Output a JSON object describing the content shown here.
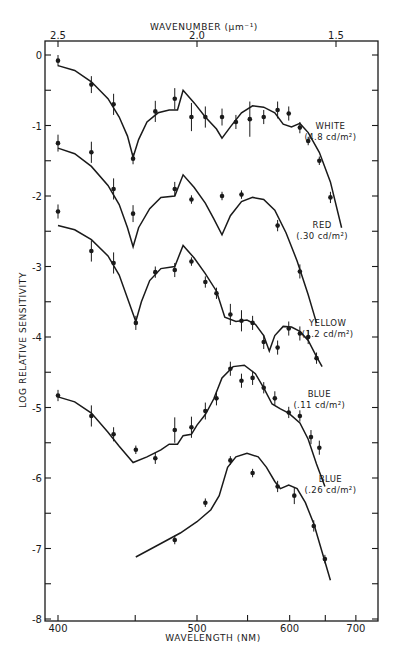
{
  "chart_data": {
    "type": "line",
    "title": "",
    "xlabel": "WAVELENGTH (NM)",
    "x2label": "WAVENUMBER (µm⁻¹)",
    "ylabel": "LOG RELATIVE SENSITIVITY",
    "ylim": [
      -8,
      0.3
    ],
    "x_wavenumber_range": [
      2.55,
      1.35
    ],
    "grid": false,
    "legend_position": "inline-right",
    "x_ticks_wavelength": [
      400,
      450,
      500,
      550,
      600,
      650,
      700
    ],
    "x_tick_labels_wavelength": [
      "400",
      "",
      "500",
      "",
      "600",
      "",
      "700"
    ],
    "x_ticks_wavenumber": [
      2.5,
      2.0,
      1.5
    ],
    "x_tick_labels_wavenumber": [
      "2.5",
      "2.0",
      "1.5"
    ],
    "y_ticks": [
      0,
      -0.5,
      -1,
      -1.5,
      -2,
      -2.5,
      -3,
      -3.5,
      -4,
      -4.5,
      -5,
      -5.5,
      -6,
      -6.5,
      -7,
      -7.5,
      -8
    ],
    "y_tick_labels": [
      "0",
      "-1",
      "-2",
      "-3",
      "-4",
      "-5",
      "-6",
      "-7",
      "-8"
    ],
    "series": [
      {
        "name": "WHITE",
        "sublabel": "(4.8 cd/m²)",
        "label_pos": [
          1.52,
          -1.05
        ],
        "points": [
          {
            "nu": 2.5,
            "y": -0.08,
            "err": 0.08
          },
          {
            "nu": 2.38,
            "y": -0.42,
            "err": 0.12
          },
          {
            "nu": 2.3,
            "y": -0.7,
            "err": 0.15
          },
          {
            "nu": 2.23,
            "y": -1.47,
            "err": 0.08
          },
          {
            "nu": 2.15,
            "y": -0.8,
            "err": 0.15
          },
          {
            "nu": 2.08,
            "y": -0.62,
            "err": 0.15
          },
          {
            "nu": 2.02,
            "y": -0.88,
            "err": 0.2
          },
          {
            "nu": 1.97,
            "y": -0.88,
            "err": 0.15
          },
          {
            "nu": 1.91,
            "y": -0.88,
            "err": 0.12
          },
          {
            "nu": 1.86,
            "y": -0.95,
            "err": 0.1
          },
          {
            "nu": 1.81,
            "y": -0.91,
            "err": 0.25
          },
          {
            "nu": 1.76,
            "y": -0.88,
            "err": 0.1
          },
          {
            "nu": 1.71,
            "y": -0.78,
            "err": 0.12
          },
          {
            "nu": 1.67,
            "y": -0.83,
            "err": 0.1
          },
          {
            "nu": 1.63,
            "y": -1.03,
            "err": 0.08
          },
          {
            "nu": 1.6,
            "y": -1.22,
            "err": 0.06
          },
          {
            "nu": 1.56,
            "y": -1.5,
            "err": 0.06
          },
          {
            "nu": 1.52,
            "y": -2.02,
            "err": 0.08
          }
        ],
        "curve": [
          [
            2.5,
            -0.15
          ],
          [
            2.44,
            -0.22
          ],
          [
            2.38,
            -0.38
          ],
          [
            2.32,
            -0.62
          ],
          [
            2.28,
            -0.88
          ],
          [
            2.25,
            -1.15
          ],
          [
            2.23,
            -1.45
          ],
          [
            2.21,
            -1.2
          ],
          [
            2.18,
            -0.95
          ],
          [
            2.14,
            -0.82
          ],
          [
            2.1,
            -0.78
          ],
          [
            2.07,
            -0.78
          ],
          [
            2.05,
            -0.5
          ],
          [
            2.01,
            -0.68
          ],
          [
            1.97,
            -0.88
          ],
          [
            1.93,
            -1.05
          ],
          [
            1.91,
            -1.18
          ],
          [
            1.88,
            -1.02
          ],
          [
            1.84,
            -0.82
          ],
          [
            1.8,
            -0.72
          ],
          [
            1.76,
            -0.74
          ],
          [
            1.72,
            -0.82
          ],
          [
            1.69,
            -0.98
          ],
          [
            1.66,
            -1.02
          ],
          [
            1.63,
            -0.97
          ],
          [
            1.6,
            -1.1
          ],
          [
            1.56,
            -1.38
          ],
          [
            1.52,
            -1.8
          ],
          [
            1.48,
            -2.45
          ]
        ]
      },
      {
        "name": "RED",
        "sublabel": "(.30 cd/m²)",
        "label_pos": [
          1.55,
          -2.45
        ],
        "points": [
          {
            "nu": 2.5,
            "y": -1.25,
            "err": 0.12
          },
          {
            "nu": 2.38,
            "y": -1.38,
            "err": 0.15
          },
          {
            "nu": 2.3,
            "y": -1.9,
            "err": 0.15
          },
          {
            "nu": 2.23,
            "y": -2.25,
            "err": 0.12
          },
          {
            "nu": 2.08,
            "y": -1.9,
            "err": 0.1
          },
          {
            "nu": 2.02,
            "y": -2.05,
            "err": 0.06
          },
          {
            "nu": 1.91,
            "y": -2.0,
            "err": 0.06
          },
          {
            "nu": 1.84,
            "y": -1.98,
            "err": 0.06
          },
          {
            "nu": 1.71,
            "y": -2.42,
            "err": 0.08
          },
          {
            "nu": 1.63,
            "y": -3.07,
            "err": 0.1
          }
        ],
        "curve": [
          [
            2.5,
            -1.32
          ],
          [
            2.44,
            -1.4
          ],
          [
            2.38,
            -1.58
          ],
          [
            2.32,
            -1.85
          ],
          [
            2.28,
            -2.12
          ],
          [
            2.25,
            -2.45
          ],
          [
            2.23,
            -2.72
          ],
          [
            2.21,
            -2.45
          ],
          [
            2.17,
            -2.18
          ],
          [
            2.13,
            -2.02
          ],
          [
            2.08,
            -2.0
          ],
          [
            2.05,
            -1.7
          ],
          [
            2.01,
            -1.88
          ],
          [
            1.97,
            -2.1
          ],
          [
            1.94,
            -2.32
          ],
          [
            1.91,
            -2.55
          ],
          [
            1.88,
            -2.28
          ],
          [
            1.84,
            -2.08
          ],
          [
            1.8,
            -2.02
          ],
          [
            1.76,
            -2.05
          ],
          [
            1.72,
            -2.2
          ],
          [
            1.68,
            -2.52
          ],
          [
            1.64,
            -2.92
          ],
          [
            1.6,
            -3.4
          ],
          [
            1.57,
            -3.8
          ]
        ]
      },
      {
        "name": "YELLOW",
        "sublabel": "(1.2 cd/m²)",
        "label_pos": [
          1.53,
          -3.85
        ],
        "points": [
          {
            "nu": 2.5,
            "y": -2.22,
            "err": 0.1
          },
          {
            "nu": 2.38,
            "y": -2.78,
            "err": 0.15
          },
          {
            "nu": 2.3,
            "y": -2.95,
            "err": 0.15
          },
          {
            "nu": 2.22,
            "y": -3.8,
            "err": 0.1
          },
          {
            "nu": 2.15,
            "y": -3.08,
            "err": 0.08
          },
          {
            "nu": 2.08,
            "y": -3.05,
            "err": 0.1
          },
          {
            "nu": 2.02,
            "y": -2.93,
            "err": 0.06
          },
          {
            "nu": 1.97,
            "y": -3.22,
            "err": 0.08
          },
          {
            "nu": 1.93,
            "y": -3.38,
            "err": 0.08
          },
          {
            "nu": 1.88,
            "y": -3.68,
            "err": 0.15
          },
          {
            "nu": 1.84,
            "y": -3.77,
            "err": 0.15
          },
          {
            "nu": 1.8,
            "y": -3.8,
            "err": 0.1
          },
          {
            "nu": 1.76,
            "y": -4.07,
            "err": 0.1
          },
          {
            "nu": 1.71,
            "y": -4.15,
            "err": 0.1
          },
          {
            "nu": 1.67,
            "y": -3.88,
            "err": 0.1
          },
          {
            "nu": 1.63,
            "y": -3.95,
            "err": 0.1
          },
          {
            "nu": 1.6,
            "y": -4.0,
            "err": 0.1
          },
          {
            "nu": 1.57,
            "y": -4.3,
            "err": 0.08
          }
        ],
        "curve": [
          [
            2.5,
            -2.42
          ],
          [
            2.44,
            -2.48
          ],
          [
            2.38,
            -2.62
          ],
          [
            2.32,
            -2.85
          ],
          [
            2.28,
            -3.12
          ],
          [
            2.25,
            -3.45
          ],
          [
            2.22,
            -3.78
          ],
          [
            2.2,
            -3.5
          ],
          [
            2.17,
            -3.2
          ],
          [
            2.13,
            -3.03
          ],
          [
            2.08,
            -3.0
          ],
          [
            2.05,
            -2.7
          ],
          [
            2.01,
            -2.88
          ],
          [
            1.97,
            -3.1
          ],
          [
            1.93,
            -3.35
          ],
          [
            1.9,
            -3.72
          ],
          [
            1.86,
            -3.78
          ],
          [
            1.82,
            -3.76
          ],
          [
            1.79,
            -3.82
          ],
          [
            1.76,
            -3.98
          ],
          [
            1.74,
            -4.2
          ],
          [
            1.72,
            -3.98
          ],
          [
            1.69,
            -3.85
          ],
          [
            1.66,
            -3.86
          ],
          [
            1.63,
            -3.92
          ],
          [
            1.6,
            -4.05
          ],
          [
            1.57,
            -4.28
          ],
          [
            1.55,
            -4.42
          ]
        ]
      },
      {
        "name": "BLUE",
        "sublabel": "(.11 cd/m²)",
        "label_pos": [
          1.56,
          -4.85
        ],
        "points": [
          {
            "nu": 2.5,
            "y": -4.83,
            "err": 0.08
          },
          {
            "nu": 2.38,
            "y": -5.12,
            "err": 0.15
          },
          {
            "nu": 2.3,
            "y": -5.38,
            "err": 0.1
          },
          {
            "nu": 2.22,
            "y": -5.6,
            "err": 0.06
          },
          {
            "nu": 2.15,
            "y": -5.72,
            "err": 0.08
          },
          {
            "nu": 2.08,
            "y": -5.32,
            "err": 0.18
          },
          {
            "nu": 2.02,
            "y": -5.28,
            "err": 0.15
          },
          {
            "nu": 1.97,
            "y": -5.05,
            "err": 0.12
          },
          {
            "nu": 1.93,
            "y": -4.87,
            "err": 0.1
          },
          {
            "nu": 1.88,
            "y": -4.45,
            "err": 0.1
          },
          {
            "nu": 1.84,
            "y": -4.62,
            "err": 0.1
          },
          {
            "nu": 1.8,
            "y": -4.58,
            "err": 0.1
          },
          {
            "nu": 1.76,
            "y": -4.72,
            "err": 0.08
          },
          {
            "nu": 1.72,
            "y": -4.87,
            "err": 0.1
          },
          {
            "nu": 1.67,
            "y": -5.07,
            "err": 0.08
          },
          {
            "nu": 1.63,
            "y": -5.12,
            "err": 0.08
          },
          {
            "nu": 1.59,
            "y": -5.42,
            "err": 0.1
          },
          {
            "nu": 1.56,
            "y": -5.57,
            "err": 0.1
          }
        ],
        "curve": [
          [
            2.5,
            -4.85
          ],
          [
            2.44,
            -4.92
          ],
          [
            2.38,
            -5.08
          ],
          [
            2.32,
            -5.35
          ],
          [
            2.28,
            -5.55
          ],
          [
            2.23,
            -5.78
          ],
          [
            2.18,
            -5.7
          ],
          [
            2.13,
            -5.6
          ],
          [
            2.1,
            -5.52
          ],
          [
            2.07,
            -5.52
          ],
          [
            2.05,
            -5.4
          ],
          [
            2.02,
            -5.38
          ],
          [
            2.0,
            -5.25
          ],
          [
            1.97,
            -5.1
          ],
          [
            1.94,
            -4.88
          ],
          [
            1.91,
            -4.58
          ],
          [
            1.87,
            -4.42
          ],
          [
            1.83,
            -4.4
          ],
          [
            1.79,
            -4.52
          ],
          [
            1.76,
            -4.72
          ],
          [
            1.73,
            -4.95
          ],
          [
            1.7,
            -5.02
          ],
          [
            1.67,
            -5.08
          ],
          [
            1.63,
            -5.22
          ],
          [
            1.6,
            -5.45
          ],
          [
            1.57,
            -5.8
          ],
          [
            1.54,
            -6.12
          ]
        ]
      },
      {
        "name": "BLUE",
        "sublabel": "(.26 cd/m²)",
        "label_pos": [
          1.52,
          -6.05
        ],
        "points": [
          {
            "nu": 2.08,
            "y": -6.88,
            "err": 0.06
          },
          {
            "nu": 1.97,
            "y": -6.35,
            "err": 0.06
          },
          {
            "nu": 1.88,
            "y": -5.75,
            "err": 0.06
          },
          {
            "nu": 1.8,
            "y": -5.93,
            "err": 0.06
          },
          {
            "nu": 1.71,
            "y": -6.12,
            "err": 0.08
          },
          {
            "nu": 1.65,
            "y": -6.25,
            "err": 0.12
          },
          {
            "nu": 1.58,
            "y": -6.68,
            "err": 0.08
          },
          {
            "nu": 1.54,
            "y": -7.15,
            "err": 0.06
          }
        ],
        "curve": [
          [
            2.22,
            -7.12
          ],
          [
            2.14,
            -6.95
          ],
          [
            2.06,
            -6.78
          ],
          [
            2.0,
            -6.62
          ],
          [
            1.95,
            -6.45
          ],
          [
            1.92,
            -6.25
          ],
          [
            1.89,
            -5.85
          ],
          [
            1.86,
            -5.7
          ],
          [
            1.82,
            -5.65
          ],
          [
            1.78,
            -5.7
          ],
          [
            1.75,
            -5.85
          ],
          [
            1.72,
            -6.05
          ],
          [
            1.7,
            -6.15
          ],
          [
            1.67,
            -6.1
          ],
          [
            1.64,
            -6.15
          ],
          [
            1.61,
            -6.35
          ],
          [
            1.58,
            -6.65
          ],
          [
            1.55,
            -7.05
          ],
          [
            1.52,
            -7.45
          ]
        ]
      }
    ]
  },
  "axes": {
    "top_title": "WAVENUMBER (µm⁻¹)",
    "bottom_title": "WAVELENGTH (NM)",
    "left_title": "LOG RELATIVE SENSITIVITY"
  }
}
